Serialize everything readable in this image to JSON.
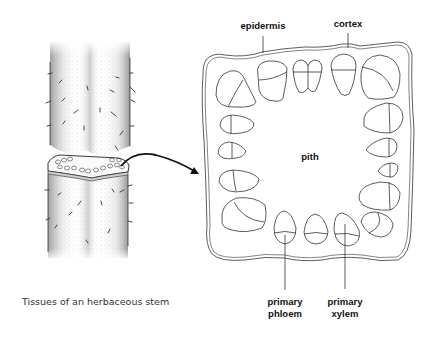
{
  "diagram": {
    "caption": "Tissues of an herbaceous stem",
    "labels": {
      "epidermis": "epidermis",
      "cortex": "cortex",
      "pith": "pith",
      "primary_phloem_line1": "primary",
      "primary_phloem_line2": "phloem",
      "primary_xylem_line1": "primary",
      "primary_xylem_line2": "xylem"
    },
    "illustrations": [
      "herbaceous-stem-with-cut-section",
      "stem-cross-section-with-vascular-bundles"
    ],
    "colors": {
      "ink": "#222222",
      "background": "#ffffff"
    }
  }
}
